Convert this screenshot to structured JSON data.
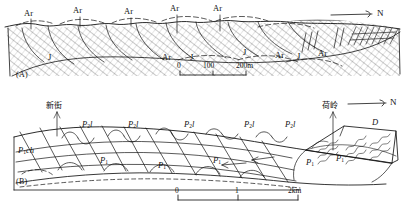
{
  "figure": {
    "type": "geological-cross-section",
    "panels": [
      "A",
      "B"
    ]
  },
  "panel_a": {
    "id": "(A)",
    "north_label": "N",
    "scale": {
      "ticks": [
        "0",
        "100",
        "200m"
      ],
      "unit": "m"
    },
    "units": [
      {
        "text": "Ar",
        "x": 24,
        "y": 14
      },
      {
        "text": "Ar",
        "x": 73,
        "y": 11
      },
      {
        "text": "Ar",
        "x": 124,
        "y": 12
      },
      {
        "text": "Ar",
        "x": 170,
        "y": 9
      },
      {
        "text": "Ar",
        "x": 213,
        "y": 9
      },
      {
        "text": "Ar",
        "x": 162,
        "y": 57
      },
      {
        "text": "Ar",
        "x": 275,
        "y": 55
      },
      {
        "text": "Ar",
        "x": 318,
        "y": 53
      },
      {
        "text": "J",
        "x": 48,
        "y": 57
      },
      {
        "text": "J",
        "x": 190,
        "y": 57
      },
      {
        "text": "J",
        "x": 243,
        "y": 52
      },
      {
        "text": "J",
        "x": 297,
        "y": 56
      }
    ]
  },
  "panel_b": {
    "id": "(B)",
    "north_label": "N",
    "scale": {
      "ticks": [
        "0",
        "1",
        "2km"
      ],
      "unit": "km"
    },
    "places": [
      {
        "name": "新街",
        "x": 55,
        "y": 104
      },
      {
        "name": "荷岭",
        "x": 330,
        "y": 104
      }
    ],
    "units": [
      {
        "base": "P",
        "sub": "2",
        "suffix": "l",
        "x": 82,
        "y": 124
      },
      {
        "base": "P",
        "sub": "2",
        "suffix": "l",
        "x": 128,
        "y": 124
      },
      {
        "base": "P",
        "sub": "2",
        "suffix": "l",
        "x": 184,
        "y": 124
      },
      {
        "base": "P",
        "sub": "2",
        "suffix": "l",
        "x": 244,
        "y": 124
      },
      {
        "base": "P",
        "sub": "2",
        "suffix": "l",
        "x": 285,
        "y": 124
      },
      {
        "base": "P",
        "sub": "1",
        "suffix": "ch",
        "x": 18,
        "y": 150
      },
      {
        "base": "P",
        "sub": "1",
        "suffix": "",
        "x": 100,
        "y": 160
      },
      {
        "base": "P",
        "sub": "1",
        "suffix": "",
        "x": 158,
        "y": 165
      },
      {
        "base": "P",
        "sub": "1",
        "suffix": "",
        "x": 213,
        "y": 160
      },
      {
        "base": "P",
        "sub": "1",
        "suffix": "",
        "x": 306,
        "y": 162
      },
      {
        "base": "P",
        "sub": "1",
        "suffix": "",
        "x": 336,
        "y": 158
      },
      {
        "base": "D",
        "sub": "",
        "suffix": "",
        "x": 372,
        "y": 122
      }
    ]
  },
  "colors": {
    "ink": "#141414",
    "background": "#ffffff"
  }
}
